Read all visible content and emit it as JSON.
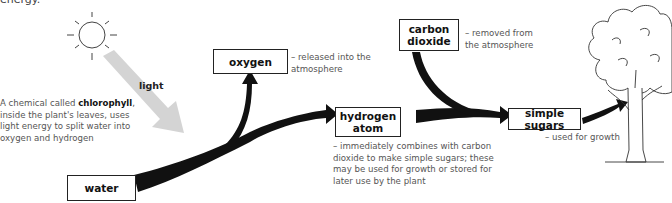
{
  "clipped_top_text": "energy.",
  "sun": {
    "icon": "sun-icon"
  },
  "light_label": "light",
  "chlorophyll_note": {
    "prefix": "A chemical called ",
    "emphasis": "chlorophyll",
    "suffix": ", inside the plant's leaves, uses light energy to split water into oxygen and hydrogen"
  },
  "boxes": {
    "water": "water",
    "oxygen": "oxygen",
    "hydrogen_line1": "hydrogen",
    "hydrogen_line2": "atom",
    "carbon_line1": "carbon",
    "carbon_line2": "dioxide",
    "sugars": "simple sugars"
  },
  "notes": {
    "oxygen": "– released into the atmosphere",
    "carbon": "– removed from the atmosphere",
    "hydrogen": "– immediately combines with carbon dioxide to make simple sugars; these may be used for growth or stored for later use by the plant",
    "sugars": "– used for growth"
  },
  "colors": {
    "arrow": "#111111",
    "light_beam": "#d4d4d4",
    "box_border": "#222222",
    "note_text": "#555555"
  },
  "tree": {
    "icon": "tree-illustration"
  }
}
